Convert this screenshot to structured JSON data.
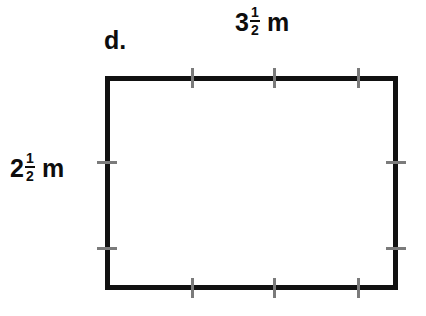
{
  "figure": {
    "part_letter": "d.",
    "background_color": "#ffffff",
    "outline_color": "#111111",
    "tick_color": "#7b7b7b",
    "shape_type": "rectangle",
    "unit": "m"
  },
  "top_measurement": {
    "whole": "3",
    "numerator": "1",
    "denominator": "2",
    "unit": "m",
    "full_text": "3 1/2 m",
    "value": 3.5
  },
  "left_measurement": {
    "whole": "2",
    "numerator": "1",
    "denominator": "2",
    "unit": "m",
    "full_text": "2 1/2 m",
    "value": 2.5
  },
  "ticks": {
    "top": [
      192,
      274,
      358
    ],
    "bottom": [
      192,
      274,
      358
    ],
    "left": [
      162,
      248
    ],
    "right": [
      162,
      248
    ]
  },
  "rectangle": {
    "left": 105,
    "top": 76,
    "width": 293,
    "height": 214
  }
}
